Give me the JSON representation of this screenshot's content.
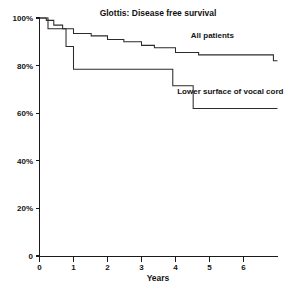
{
  "chart_data": {
    "type": "line",
    "title": "Glottis: Disease free survival",
    "xlabel": "Years",
    "ylabel": "",
    "xlim": [
      0,
      7
    ],
    "ylim": [
      0,
      100
    ],
    "grid": false,
    "legend_position": "inline-annotation",
    "x_ticks": [
      "0",
      "1",
      "2",
      "3",
      "4",
      "5",
      "6"
    ],
    "x_tick_values": [
      0,
      1,
      2,
      3,
      4,
      5,
      6
    ],
    "y_ticks": [
      "0",
      "20%",
      "40%",
      "60%",
      "80%",
      "100%"
    ],
    "y_tick_values": [
      0,
      20,
      40,
      60,
      80,
      100
    ],
    "series": [
      {
        "name": "All patients",
        "step": "post",
        "label_x": 4.45,
        "label_y": 91.5,
        "points": [
          [
            0.0,
            100.0
          ],
          [
            0.12,
            100.0
          ],
          [
            0.2,
            99.0
          ],
          [
            0.38,
            99.0
          ],
          [
            0.42,
            97.0
          ],
          [
            0.62,
            97.0
          ],
          [
            0.68,
            95.5
          ],
          [
            0.95,
            95.5
          ],
          [
            1.0,
            93.5
          ],
          [
            1.45,
            93.5
          ],
          [
            1.52,
            92.5
          ],
          [
            1.95,
            92.5
          ],
          [
            2.0,
            91.0
          ],
          [
            2.42,
            91.0
          ],
          [
            2.48,
            90.0
          ],
          [
            2.95,
            90.0
          ],
          [
            3.0,
            88.5
          ],
          [
            3.32,
            88.5
          ],
          [
            3.38,
            87.5
          ],
          [
            3.95,
            87.5
          ],
          [
            4.0,
            85.5
          ],
          [
            4.62,
            85.5
          ],
          [
            4.68,
            84.5
          ],
          [
            6.82,
            84.5
          ],
          [
            6.88,
            82.0
          ],
          [
            7.0,
            82.0
          ]
        ]
      },
      {
        "name": "Lower surface of vocal cord",
        "step": "post",
        "label_x": 4.05,
        "label_y": 68.0,
        "points": [
          [
            0.0,
            100.0
          ],
          [
            0.2,
            100.0
          ],
          [
            0.25,
            95.5
          ],
          [
            0.72,
            95.5
          ],
          [
            0.78,
            88.0
          ],
          [
            0.95,
            88.0
          ],
          [
            1.0,
            78.5
          ],
          [
            3.85,
            78.5
          ],
          [
            3.92,
            71.5
          ],
          [
            4.45,
            71.5
          ],
          [
            4.52,
            62.0
          ],
          [
            7.0,
            62.0
          ]
        ]
      }
    ],
    "annotations": [
      {
        "text": "All patients",
        "x": 4.45,
        "y": 91.5
      },
      {
        "text": "Lower surface of vocal cord",
        "x": 4.05,
        "y": 68.0
      }
    ]
  }
}
